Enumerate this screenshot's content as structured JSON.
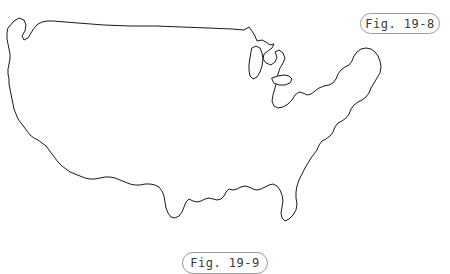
{
  "figure": {
    "background_color": "#ffffff",
    "outline_color": "#1a1a1a",
    "label_border_color": "#9a9a9a",
    "label_text_color": "#3a3a3a",
    "map_name": "contiguous-united-states-outline",
    "labels": {
      "top_right": "Fig. 19-8",
      "bottom_center": "Fig. 19-9"
    }
  }
}
